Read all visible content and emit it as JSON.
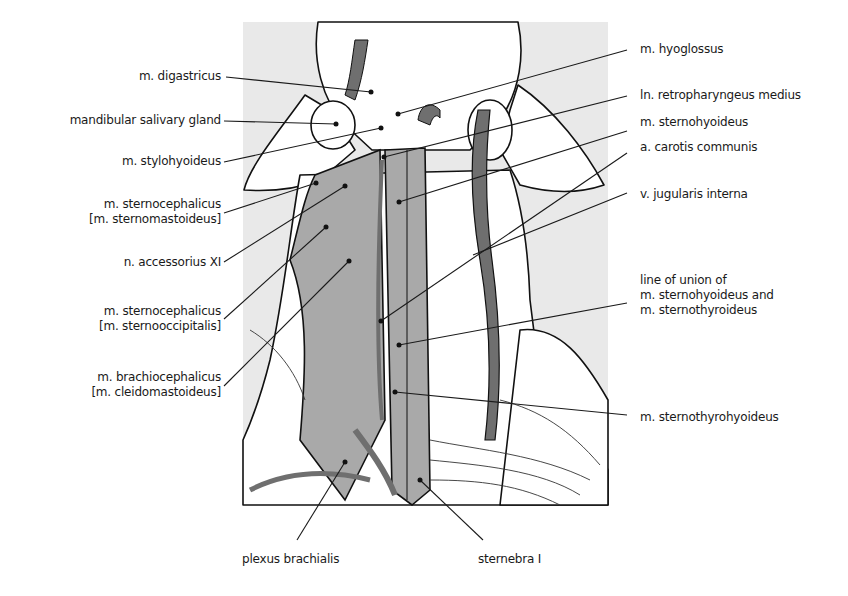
{
  "figure": {
    "colors": {
      "background_panel": "#e9e9e9",
      "muscle_fill": "#a9a9a9",
      "vessel_fill": "#6f6f6f",
      "outline": "#111111",
      "leader_line": "#1a1a1a"
    }
  },
  "labels_left": [
    {
      "id": "digastricus",
      "lines": [
        "m. digastricus"
      ]
    },
    {
      "id": "mandibular-gland",
      "lines": [
        "mandibular salivary gland"
      ]
    },
    {
      "id": "stylohyoideus",
      "lines": [
        "m. stylohyoideus"
      ]
    },
    {
      "id": "sternomastoideus",
      "lines": [
        "m. sternocephalicus",
        "[m. sternomastoideus]"
      ]
    },
    {
      "id": "accessorius",
      "lines": [
        "n. accessorius XI"
      ]
    },
    {
      "id": "sternooccipitalis",
      "lines": [
        "m. sternocephalicus",
        "[m. sternooccipitalis]"
      ]
    },
    {
      "id": "cleidomastoideus",
      "lines": [
        "m. brachiocephalicus",
        "[m. cleidomastoideus]"
      ]
    }
  ],
  "labels_right": [
    {
      "id": "hyoglossus",
      "lines": [
        "m. hyoglossus"
      ]
    },
    {
      "id": "retropharyngeus",
      "lines": [
        "ln. retropharyngeus medius"
      ]
    },
    {
      "id": "sternohyoideus",
      "lines": [
        "m. sternohyoideus"
      ]
    },
    {
      "id": "carotis",
      "lines": [
        "a. carotis communis"
      ]
    },
    {
      "id": "jugularis",
      "lines": [
        "v. jugularis interna"
      ]
    },
    {
      "id": "line-of-union",
      "lines": [
        "line of union of",
        "m. sternohyoideus and",
        "m. sternothyroideus"
      ]
    },
    {
      "id": "sternothyrohyoideus",
      "lines": [
        "m. sternothyrohyoideus"
      ]
    }
  ],
  "labels_bottom": [
    {
      "id": "plexus",
      "lines": [
        "plexus brachialis"
      ]
    },
    {
      "id": "sternebra",
      "lines": [
        "sternebra I"
      ]
    }
  ]
}
